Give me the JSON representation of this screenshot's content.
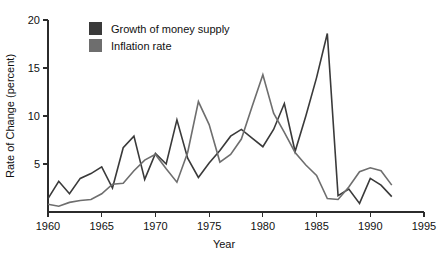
{
  "chart_data": {
    "type": "line",
    "title": "",
    "xlabel": "Year",
    "ylabel": "Rate of Change (percent)",
    "xlim": [
      1960,
      1995
    ],
    "ylim": [
      0,
      20
    ],
    "xticks": [
      1960,
      1965,
      1970,
      1975,
      1980,
      1985,
      1990,
      1995
    ],
    "xticklabels": [
      "1960",
      "1965",
      "1970",
      "1975",
      "1980",
      "1985",
      "1990",
      "1995"
    ],
    "yticks": [
      5,
      10,
      15,
      20
    ],
    "yticklabels": [
      "5",
      "10",
      "15",
      "20"
    ],
    "grid": false,
    "legend_position": "top-left-inside",
    "x": [
      1960,
      1961,
      1962,
      1963,
      1964,
      1965,
      1966,
      1967,
      1968,
      1969,
      1970,
      1971,
      1972,
      1973,
      1974,
      1975,
      1976,
      1977,
      1978,
      1979,
      1980,
      1981,
      1982,
      1983,
      1984,
      1985,
      1986,
      1987,
      1988,
      1989,
      1990,
      1991,
      1992
    ],
    "series": [
      {
        "name": "Growth of money supply",
        "color": "#3a3a3a",
        "values": [
          1.4,
          3.2,
          1.9,
          3.5,
          4.0,
          4.7,
          2.5,
          6.7,
          7.9,
          3.4,
          6.1,
          5.0,
          9.6,
          5.6,
          3.6,
          5.1,
          6.4,
          7.9,
          8.6,
          7.7,
          6.8,
          8.6,
          11.3,
          6.3,
          10.0,
          14.0,
          18.6,
          1.7,
          2.4,
          0.9,
          3.5,
          2.8,
          1.6
        ]
      },
      {
        "name": "Inflation rate",
        "color": "#6e6e6e",
        "values": [
          0.8,
          0.6,
          1.0,
          1.2,
          1.3,
          1.9,
          2.9,
          3.0,
          4.3,
          5.4,
          6.0,
          4.5,
          3.1,
          6.2,
          11.5,
          9.1,
          5.2,
          6.0,
          7.6,
          11.0,
          14.3,
          10.3,
          8.3,
          6.2,
          4.9,
          3.8,
          1.4,
          1.3,
          2.6,
          4.2,
          4.6,
          4.3,
          2.8
        ]
      }
    ],
    "legend": [
      {
        "label": "Growth of money supply",
        "color": "#3a3a3a",
        "swatch": "dark-square"
      },
      {
        "label": "Inflation rate",
        "color": "#6e6e6e",
        "swatch": "gray-square"
      }
    ]
  }
}
